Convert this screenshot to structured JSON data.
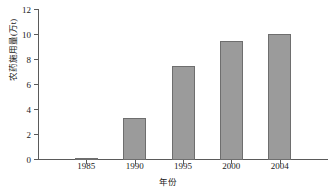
{
  "chart_data": {
    "type": "bar",
    "title": "",
    "categories": [
      "1985",
      "1990",
      "1995",
      "2000",
      "2004"
    ],
    "values": [
      0.15,
      3.35,
      7.5,
      9.5,
      10.1
    ],
    "series": [
      {
        "name": "农药施用量",
        "values": [
          0.15,
          3.35,
          7.5,
          9.5,
          10.1
        ]
      }
    ],
    "xlabel": "年份",
    "ylabel": "农药施用量(万t)",
    "ylim": [
      0,
      12
    ],
    "yticks": [
      0,
      2,
      4,
      6,
      8,
      10,
      12
    ],
    "ytick_labels": [
      "0",
      "2",
      "4",
      "6",
      "8",
      "10",
      "12"
    ],
    "xtick_labels": [
      "1985",
      "1990",
      "1995",
      "2000",
      "2004"
    ],
    "grid": false,
    "legend": false,
    "bar_color": "#9b9b9b",
    "bar_border_color": "#6e6e6e",
    "axis_color": "#5a5a5a"
  }
}
